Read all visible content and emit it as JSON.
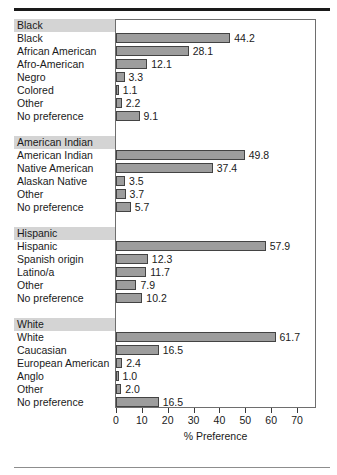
{
  "figure": {
    "axis_title": "% Preference",
    "bar_color": "#9d9d9d",
    "bar_border_color": "#434343",
    "group_header_bg": "#d4d4d4",
    "frame_color": "#6e6e6e"
  },
  "chart_data": {
    "type": "bar",
    "orientation": "horizontal",
    "title": "",
    "xlabel": "% Preference",
    "ylabel": "",
    "xlim": [
      0,
      70
    ],
    "xticks": [
      0,
      10,
      20,
      30,
      40,
      50,
      60,
      70
    ],
    "xtick_labels": [
      "0",
      "10",
      "20",
      "30",
      "40",
      "50",
      "60",
      "70"
    ],
    "grid": false,
    "legend": false,
    "groups": [
      {
        "name": "Black",
        "categories": [
          "Black",
          "African American",
          "Afro-American",
          "Negro",
          "Colored",
          "Other",
          "No preference"
        ],
        "values": [
          44.2,
          28.1,
          12.1,
          3.3,
          1.1,
          2.2,
          9.1
        ],
        "value_labels": [
          "44.2",
          "28.1",
          "12.1",
          "3.3",
          "1.1",
          "2.2",
          "9.1"
        ]
      },
      {
        "name": "American Indian",
        "categories": [
          "American Indian",
          "Native American",
          "Alaskan Native",
          "Other",
          "No preference"
        ],
        "values": [
          49.8,
          37.4,
          3.5,
          3.7,
          5.7
        ],
        "value_labels": [
          "49.8",
          "37.4",
          "3.5",
          "3.7",
          "5.7"
        ]
      },
      {
        "name": "Hispanic",
        "categories": [
          "Hispanic",
          "Spanish origin",
          "Latino/a",
          "Other",
          "No preference"
        ],
        "values": [
          57.9,
          12.3,
          11.7,
          7.9,
          10.2
        ],
        "value_labels": [
          "57.9",
          "12.3",
          "11.7",
          "7.9",
          "10.2"
        ]
      },
      {
        "name": "White",
        "categories": [
          "White",
          "Caucasian",
          "European American",
          "Anglo",
          "Other",
          "No preference"
        ],
        "values": [
          61.7,
          16.5,
          2.4,
          1.0,
          2.0,
          16.5
        ],
        "value_labels": [
          "61.7",
          "16.5",
          "2.4",
          "1.0",
          "2.0",
          "16.5"
        ]
      }
    ]
  }
}
